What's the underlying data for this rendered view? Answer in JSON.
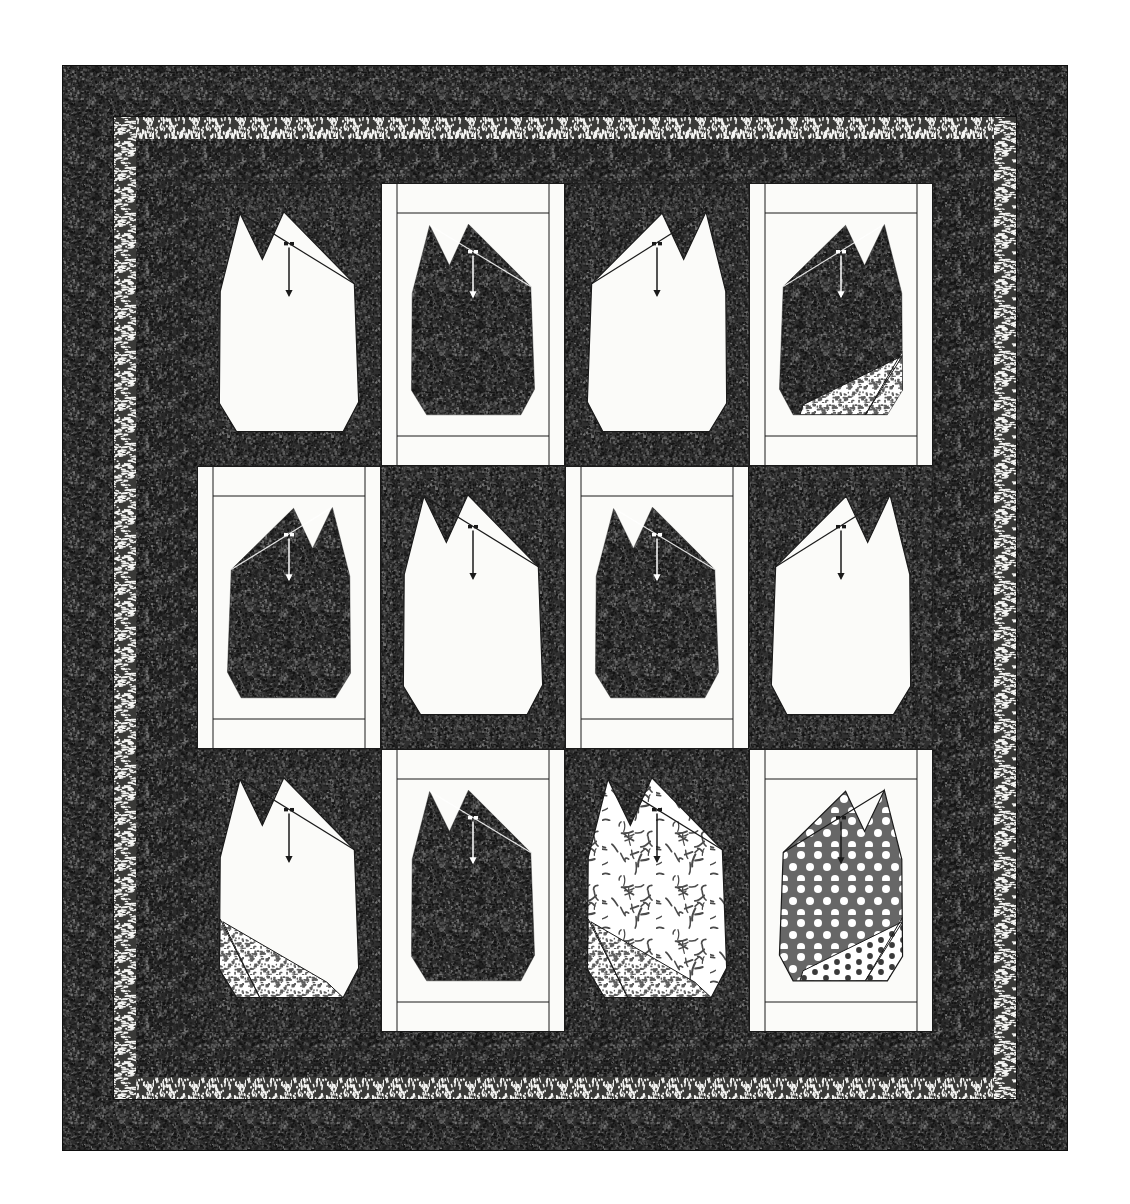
{
  "artwork": {
    "title": "Cat Block Sampler Quilt Diagram",
    "type": "quilt-layout-diagram",
    "canvas": {
      "width": 1130,
      "height": 1204,
      "background": "#ffffff"
    },
    "quilt_bounds": {
      "x": 62,
      "y": 65,
      "width": 1006,
      "height": 1086
    }
  },
  "palette": {
    "paper_white": "#ffffff",
    "fabric_white": "#fbfbf9",
    "dark_texture": "#2b2b2b",
    "dark_texture_alt": "#3a3a3a",
    "outline_black": "#1a1a1a",
    "medium_gray": "#6e6e6e",
    "speckle_light": "#f2f2f0",
    "dot_gray": "#676767"
  },
  "borders": [
    {
      "name": "outer-border",
      "fabric": "dark-mottled",
      "color": "#2e2e2e",
      "inset": 0,
      "thickness": 51
    },
    {
      "name": "speckle-border",
      "fabric": "white-speckle-on-dark",
      "color": "#d8d8d4",
      "inset": 51,
      "thickness": 23
    },
    {
      "name": "inner-border",
      "fabric": "dark-mottled",
      "color": "#2b2b2b",
      "inset": 74,
      "thickness": 61
    }
  ],
  "grid": {
    "columns": 4,
    "rows": 3,
    "block_count": 12,
    "field_bounds": {
      "x": 135,
      "y": 118,
      "width": 736,
      "height": 850
    },
    "block_width": 184,
    "block_height": 283
  },
  "legend": {
    "face_marker": "two-eye-dots-with-down-arrow",
    "arrow_direction": "down",
    "eye_count": 2
  },
  "blocks": [
    {
      "id": 1,
      "row": 1,
      "col": 1,
      "background": "dark",
      "cat_fabric": "solid-white",
      "cat_color": "#fbfbf9",
      "sashing": false,
      "has_foot_patch": false,
      "foot_fabric": "none",
      "arrow_color": "#1a1a1a",
      "ear_tilt": "right"
    },
    {
      "id": 2,
      "row": 1,
      "col": 2,
      "background": "light",
      "cat_fabric": "dark-mottled",
      "cat_color": "#2b2b2b",
      "sashing": true,
      "has_foot_patch": false,
      "foot_fabric": "none",
      "arrow_color": "#ffffff",
      "ear_tilt": "right"
    },
    {
      "id": 3,
      "row": 1,
      "col": 3,
      "background": "dark",
      "cat_fabric": "solid-white",
      "cat_color": "#fbfbf9",
      "sashing": false,
      "has_foot_patch": false,
      "foot_fabric": "none",
      "arrow_color": "#1a1a1a",
      "ear_tilt": "left"
    },
    {
      "id": 4,
      "row": 1,
      "col": 4,
      "background": "light",
      "cat_fabric": "dark-mottled",
      "cat_color": "#2b2b2b",
      "sashing": true,
      "has_foot_patch": true,
      "foot_fabric": "light-speckle",
      "arrow_color": "#ffffff",
      "ear_tilt": "left"
    },
    {
      "id": 5,
      "row": 2,
      "col": 1,
      "background": "light",
      "cat_fabric": "dark-mottled",
      "cat_color": "#2b2b2b",
      "sashing": true,
      "has_foot_patch": false,
      "foot_fabric": "none",
      "arrow_color": "#ffffff",
      "ear_tilt": "left"
    },
    {
      "id": 6,
      "row": 2,
      "col": 2,
      "background": "dark",
      "cat_fabric": "solid-white",
      "cat_color": "#fbfbf9",
      "sashing": false,
      "has_foot_patch": false,
      "foot_fabric": "none",
      "arrow_color": "#1a1a1a",
      "ear_tilt": "right"
    },
    {
      "id": 7,
      "row": 2,
      "col": 3,
      "background": "light",
      "cat_fabric": "dark-mottled",
      "cat_color": "#2b2b2b",
      "sashing": true,
      "has_foot_patch": false,
      "foot_fabric": "none",
      "arrow_color": "#ffffff",
      "ear_tilt": "right"
    },
    {
      "id": 8,
      "row": 2,
      "col": 4,
      "background": "dark",
      "cat_fabric": "solid-white",
      "cat_color": "#fbfbf9",
      "sashing": false,
      "has_foot_patch": false,
      "foot_fabric": "none",
      "arrow_color": "#1a1a1a",
      "ear_tilt": "left"
    },
    {
      "id": 9,
      "row": 3,
      "col": 1,
      "background": "dark",
      "cat_fabric": "solid-white",
      "cat_color": "#fbfbf9",
      "sashing": false,
      "has_foot_patch": true,
      "foot_fabric": "light-speckle",
      "arrow_color": "#1a1a1a",
      "ear_tilt": "right"
    },
    {
      "id": 10,
      "row": 3,
      "col": 2,
      "background": "light",
      "cat_fabric": "dark-mottled",
      "cat_color": "#2b2b2b",
      "sashing": true,
      "has_foot_patch": false,
      "foot_fabric": "none",
      "arrow_color": "#ffffff",
      "ear_tilt": "right"
    },
    {
      "id": 11,
      "row": 3,
      "col": 3,
      "background": "dark",
      "cat_fabric": "squiggle-print",
      "cat_color": "#fbfbf9",
      "sashing": false,
      "has_foot_patch": true,
      "foot_fabric": "light-speckle",
      "arrow_color": "#1a1a1a",
      "ear_tilt": "right"
    },
    {
      "id": 12,
      "row": 3,
      "col": 4,
      "background": "light",
      "cat_fabric": "gray-polka-dot",
      "cat_color": "#676767",
      "sashing": true,
      "has_foot_patch": true,
      "foot_fabric": "dark-polka-dot",
      "arrow_color": "#1a1a1a",
      "ear_tilt": "left"
    }
  ]
}
